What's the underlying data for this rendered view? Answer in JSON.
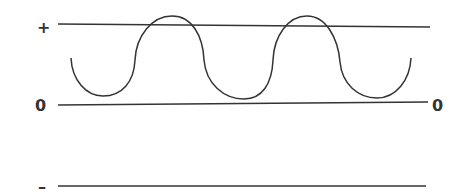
{
  "diagram": {
    "type": "waveform",
    "labels": {
      "plus": "+",
      "zero_left": "0",
      "zero_right": "0",
      "minus": "–"
    },
    "reference_lines": [
      {
        "name": "positive-level",
        "label": "+"
      },
      {
        "name": "zero-level",
        "label": "0"
      },
      {
        "name": "negative-level",
        "label": "–"
      }
    ],
    "waveform": {
      "description": "Oscillating wave centered above the zero line, crossing the positive level at its two peaks",
      "peaks": 2,
      "troughs": 3
    },
    "colors": {
      "line": "#333333",
      "background": "#ffffff"
    }
  }
}
